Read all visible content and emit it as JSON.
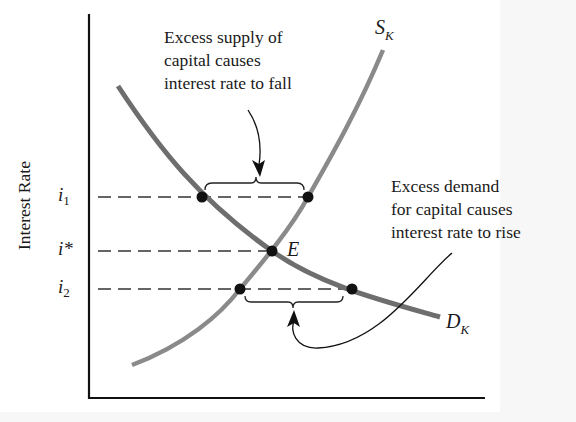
{
  "diagram": {
    "type": "supply-demand-capital-market",
    "y_axis_label": "Interest Rate",
    "x_axis_label": "",
    "ticks": [
      {
        "id": "i1",
        "base": "i",
        "sub": "1",
        "y": 197
      },
      {
        "id": "istar",
        "base": "i*",
        "sub": "",
        "y": 251
      },
      {
        "id": "i2",
        "base": "i",
        "sub": "2",
        "y": 289
      }
    ],
    "curves": {
      "supply": {
        "base": "S",
        "sub": "K",
        "color": "#808080"
      },
      "demand": {
        "base": "D",
        "sub": "K",
        "color": "#6e6e6e"
      }
    },
    "equilibrium_label": "E",
    "annotations": {
      "excess_supply": [
        "Excess supply of",
        "capital causes",
        "interest rate to fall"
      ],
      "excess_demand": [
        "Excess demand",
        "for capital causes",
        "interest rate to rise"
      ]
    },
    "points": [
      {
        "name": "demand-at-i1",
        "x": 202,
        "y": 197
      },
      {
        "name": "supply-at-i1",
        "x": 308,
        "y": 197
      },
      {
        "name": "equilibrium",
        "x": 272,
        "y": 251
      },
      {
        "name": "supply-at-i2",
        "x": 240,
        "y": 289
      },
      {
        "name": "demand-at-i2",
        "x": 352,
        "y": 289
      }
    ]
  }
}
